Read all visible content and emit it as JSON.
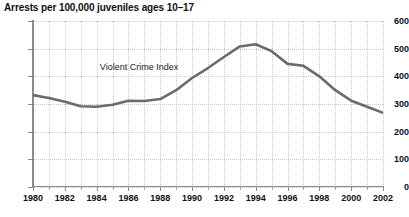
{
  "chart_data": {
    "type": "line",
    "title": "Arrests per 100,000 juveniles ages 10–17",
    "xlabel": "",
    "ylabel": "",
    "xlim": [
      1980,
      2002
    ],
    "ylim": [
      0,
      600
    ],
    "grid": true,
    "legend_position": "inline-annotation",
    "annotations": [
      {
        "text": "Violent Crime Index",
        "x": 1984.2,
        "y": 430
      }
    ],
    "y_ticks": [
      0,
      100,
      200,
      300,
      400,
      500,
      600
    ],
    "y_tick_labels": [
      "0",
      "100",
      "200",
      "300",
      "400",
      "500",
      "600"
    ],
    "x_ticks": [
      1980,
      1982,
      1984,
      1986,
      1988,
      1990,
      1992,
      1994,
      1996,
      1998,
      2000,
      2002
    ],
    "x_tick_labels": [
      "1980",
      "1982",
      "1984",
      "1986",
      "1988",
      "1990",
      "1992",
      "1994",
      "1996",
      "1998",
      "2000",
      "2002"
    ],
    "x_minor_ticks": [
      1981,
      1983,
      1985,
      1987,
      1989,
      1991,
      1993,
      1995,
      1997,
      1999,
      2001
    ],
    "series": [
      {
        "name": "Violent Crime Index",
        "color": "#6b6b6b",
        "x": [
          1980,
          1981,
          1982,
          1983,
          1984,
          1985,
          1986,
          1987,
          1988,
          1989,
          1990,
          1991,
          1992,
          1993,
          1994,
          1995,
          1996,
          1997,
          1998,
          1999,
          2000,
          2001,
          2002
        ],
        "values": [
          332,
          322,
          308,
          292,
          290,
          297,
          312,
          311,
          318,
          350,
          394,
          430,
          470,
          508,
          516,
          491,
          445,
          438,
          400,
          350,
          312,
          290,
          268
        ]
      }
    ]
  },
  "colors": {
    "line": "#6b6b6b",
    "axis": "#8a8a8a",
    "grid": "#c9c9c9",
    "text": "#111111",
    "background": "#ffffff"
  }
}
